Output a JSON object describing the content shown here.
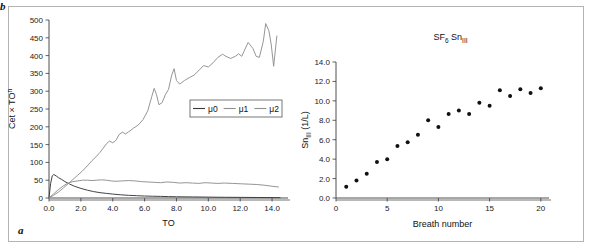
{
  "figure": {
    "panels": [
      {
        "letter": "a"
      },
      {
        "letter": "b"
      }
    ]
  },
  "panel_a": {
    "letter": "a",
    "ylabel_main": "Cet × TO",
    "ylabel_sup": "n",
    "xlabel": "TO",
    "xticks": [
      "0.0",
      "2.0",
      "4.0",
      "6.0",
      "8.0",
      "10.0",
      "12.0",
      "14.0"
    ],
    "yticks": [
      "0",
      "50",
      "100",
      "150",
      "200",
      "250",
      "300",
      "350",
      "400",
      "450",
      "500"
    ],
    "legend": [
      {
        "label": "μ0",
        "color": "#3a3a3a"
      },
      {
        "label": "μ1",
        "color": "#8f8f8f"
      },
      {
        "label": "μ2",
        "color": "#8f8f8f"
      }
    ]
  },
  "panel_b": {
    "letter": "b",
    "title_main": "SF",
    "title_sub": "6",
    "title_main2": " Sn",
    "title_sub2": "III",
    "ylabel_main": "Sn",
    "ylabel_sub": "III",
    "ylabel_unit": " (1/L)",
    "xlabel": "Breath number",
    "xticks": [
      "0",
      "5",
      "10",
      "15",
      "20"
    ],
    "yticks": [
      "0.0",
      "2.0",
      "4.0",
      "6.0",
      "8.0",
      "10.0",
      "12.0",
      "14.0"
    ]
  },
  "chart_data": [
    {
      "type": "line",
      "panel": "a",
      "title": "",
      "xlabel": "TO",
      "ylabel": "Cet × TO^n",
      "xlim": [
        0,
        15
      ],
      "ylim": [
        0,
        500
      ],
      "grid": false,
      "legend_position": "center-right",
      "series": [
        {
          "name": "μ0",
          "color": "#3a3a3a",
          "x": [
            0.0,
            0.1,
            0.2,
            0.3,
            0.45,
            0.6,
            0.8,
            1.0,
            1.3,
            1.6,
            2.0,
            2.4,
            2.8,
            3.2,
            3.6,
            4.0,
            4.5,
            5.0,
            5.5,
            6.0,
            6.5,
            7.0,
            7.5,
            8.0,
            9.0,
            10.0,
            11.0,
            12.0,
            13.0,
            14.0,
            14.5
          ],
          "y": [
            0,
            40,
            62,
            66,
            62,
            57,
            52,
            46,
            39,
            33,
            27,
            22,
            18,
            15,
            13,
            11,
            9,
            7.5,
            6.5,
            5.5,
            5,
            4.5,
            4,
            3.5,
            3,
            2.5,
            2,
            1.8,
            1.5,
            1.2,
            1
          ]
        },
        {
          "name": "μ1",
          "color": "#8f8f8f",
          "x": [
            0.0,
            0.3,
            0.6,
            0.9,
            1.2,
            1.5,
            1.8,
            2.1,
            2.4,
            2.7,
            3.0,
            3.3,
            3.6,
            3.9,
            4.2,
            4.6,
            5.0,
            5.4,
            5.8,
            6.2,
            6.6,
            7.0,
            7.4,
            7.8,
            8.2,
            8.6,
            9.0,
            9.4,
            9.8,
            10.2,
            10.6,
            11.0,
            11.5,
            12.0,
            12.5,
            13.0,
            13.5,
            14.0,
            14.4
          ],
          "y": [
            0,
            12,
            24,
            34,
            42,
            46,
            48,
            50,
            50,
            49,
            50,
            51,
            50,
            48,
            47,
            48,
            49,
            48,
            46,
            45,
            44,
            43,
            45,
            44,
            42,
            43,
            42,
            41,
            43,
            42,
            41,
            42,
            41,
            40,
            39,
            38,
            36,
            33,
            31
          ]
        },
        {
          "name": "μ2",
          "color": "#8f8f8f",
          "x": [
            0.0,
            0.3,
            0.6,
            0.9,
            1.2,
            1.5,
            1.8,
            2.1,
            2.4,
            2.7,
            3.0,
            3.2,
            3.4,
            3.6,
            3.8,
            4.0,
            4.2,
            4.4,
            4.6,
            4.8,
            5.0,
            5.3,
            5.6,
            5.9,
            6.2,
            6.45,
            6.6,
            6.75,
            6.9,
            7.1,
            7.3,
            7.5,
            7.7,
            7.85,
            8.0,
            8.2,
            8.5,
            8.8,
            9.1,
            9.4,
            9.7,
            10.0,
            10.3,
            10.6,
            10.9,
            11.1,
            11.4,
            11.7,
            11.9,
            12.1,
            12.3,
            12.5,
            12.8,
            13.0,
            13.2,
            13.45,
            13.6,
            13.8,
            13.95,
            14.1,
            14.3
          ],
          "y": [
            0,
            8,
            17,
            28,
            40,
            52,
            64,
            76,
            90,
            105,
            118,
            128,
            140,
            152,
            160,
            155,
            162,
            178,
            185,
            180,
            186,
            196,
            205,
            220,
            245,
            285,
            308,
            290,
            262,
            268,
            290,
            305,
            345,
            363,
            330,
            320,
            330,
            338,
            345,
            358,
            372,
            368,
            380,
            395,
            404,
            398,
            392,
            398,
            405,
            398,
            418,
            437,
            420,
            398,
            395,
            440,
            490,
            470,
            430,
            370,
            455
          ]
        }
      ]
    },
    {
      "type": "scatter",
      "panel": "b",
      "title": "SF6 SnIII",
      "xlabel": "Breath number",
      "ylabel": "SnIII (1/L)",
      "xlim": [
        0,
        20.8
      ],
      "ylim": [
        0,
        14.0
      ],
      "grid": false,
      "marker_color": "#111111",
      "x": [
        1,
        2,
        3,
        4,
        5,
        6,
        7,
        8,
        9,
        10,
        11,
        12,
        13,
        14,
        15,
        16,
        17,
        18,
        19,
        20
      ],
      "y": [
        1.15,
        1.8,
        2.5,
        3.7,
        4.0,
        5.35,
        5.75,
        6.5,
        8.0,
        7.3,
        8.65,
        9.0,
        8.65,
        9.8,
        9.5,
        11.1,
        10.5,
        11.2,
        10.8,
        11.3
      ]
    }
  ]
}
